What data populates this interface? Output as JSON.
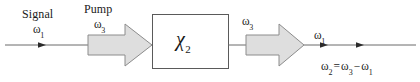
{
  "figure": {
    "type": "optical-parametric-process-diagram",
    "background_color": "#ffffff",
    "line_color": "#4d4d4d",
    "arrow_fill_color": "#dedede",
    "arrow_stroke_color": "#8c8c8c",
    "box_stroke_color": "#5a5a5a",
    "text_color": "#1a1a1a"
  },
  "labels": {
    "signal_word": "Signal",
    "signal_omega": "ω",
    "signal_omega_sub": "1",
    "pump_word": "Pump",
    "pump_omega": "ω",
    "pump_omega_sub": "3",
    "output_pump_omega": "ω",
    "output_pump_omega_sub": "3",
    "output_signal_omega": "ω",
    "output_signal_omega_sub": "1",
    "crystal_symbol": "χ",
    "crystal_symbol_sub": "2"
  },
  "equation": {
    "lhs": "ω",
    "lhs_sub": "2",
    "equals": "=",
    "term1": "ω",
    "term1_sub": "3",
    "minus": "−",
    "term2": "ω",
    "term2_sub": "1",
    "full_text": "ω₂ = ω₃ − ω₁"
  }
}
